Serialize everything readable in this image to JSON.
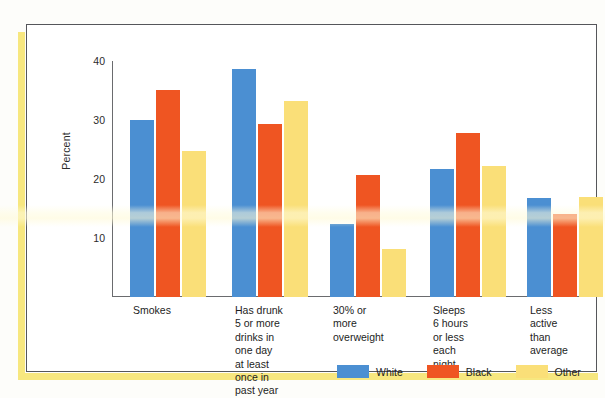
{
  "chart_data": {
    "type": "bar",
    "title": "",
    "xlabel": "",
    "ylabel": "Percent",
    "ylim": [
      0,
      40
    ],
    "yticks": [
      10,
      20,
      30,
      40
    ],
    "grid": false,
    "legend_position": "bottom-right",
    "categories": [
      "Smokes",
      "Has drunk\n5 or more\ndrinks in\none day\nat least\nonce in\npast year",
      "30% or\nmore\noverweight",
      "Sleeps\n6 hours\nor less\neach\nnight",
      "Less\nactive\nthan\naverage"
    ],
    "series": [
      {
        "name": "White",
        "color": "#4b8fd2",
        "values": [
          30,
          38.6,
          12.3,
          21.7,
          16.8
        ]
      },
      {
        "name": "Black",
        "color": "#ef5522",
        "values": [
          35.1,
          29.3,
          20.6,
          27.8,
          14
        ]
      },
      {
        "name": "Other",
        "color": "#fadf78",
        "values": [
          24.7,
          33.3,
          8.2,
          22.2,
          16.9
        ]
      }
    ]
  },
  "legend": {
    "items": [
      {
        "label": "White",
        "color": "#4b8fd2"
      },
      {
        "label": "Black",
        "color": "#ef5522"
      },
      {
        "label": "Other",
        "color": "#fadf78"
      }
    ]
  },
  "axis": {
    "y_title": "Percent",
    "y_tick_labels": [
      "40",
      "30",
      "20",
      "10"
    ]
  }
}
